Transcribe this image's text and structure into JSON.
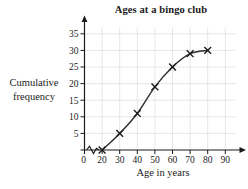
{
  "chart_data": {
    "type": "line",
    "title": "Ages at a bingo club",
    "xlabel": "Age in years",
    "ylabel": "Cumulative frequency",
    "series": [
      {
        "name": "Cumulative frequency",
        "x": [
          20,
          30,
          40,
          50,
          60,
          70,
          80
        ],
        "y": [
          0,
          5,
          11,
          19,
          25,
          29,
          30
        ]
      }
    ],
    "x_ticks": [
      0,
      20,
      30,
      40,
      50,
      60,
      70,
      80,
      90
    ],
    "y_ticks": [
      0,
      5,
      10,
      15,
      20,
      25,
      30,
      35
    ],
    "xlim": [
      0,
      100
    ],
    "ylim": [
      0,
      37
    ],
    "x_axis_break_between": [
      0,
      20
    ],
    "marker": "x",
    "grid": true,
    "legend": "none",
    "colors": {
      "line": "#2e2e2e",
      "marker": "#1c1c1c",
      "grid": "#e3e3e3",
      "axis": "#1a1a1a",
      "text": "#1a1a1a",
      "background": "#ffffff"
    }
  }
}
